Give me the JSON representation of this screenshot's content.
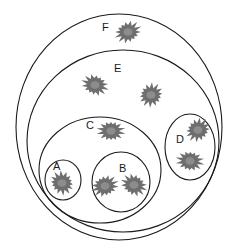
{
  "diagram": {
    "type": "nested-sets",
    "colors": {
      "boundary": "#1a1a1a",
      "blob": "#6e6e6e",
      "blob_center": "#8c8c8c",
      "background": "#ffffff"
    },
    "sets": [
      {
        "id": "F",
        "label": "F",
        "cx": 119,
        "cy": 127,
        "rx": 103,
        "ry": 113,
        "label_x": 102,
        "label_y": 31,
        "parent": null
      },
      {
        "id": "E",
        "label": "E",
        "cx": 123,
        "cy": 141,
        "rx": 96,
        "ry": 91,
        "label_x": 114,
        "label_y": 72,
        "parent": "F"
      },
      {
        "id": "C",
        "label": "C",
        "cx": 100,
        "cy": 170,
        "rx": 61,
        "ry": 53,
        "label_x": 86,
        "label_y": 129,
        "parent": "E"
      },
      {
        "id": "A",
        "label": "A",
        "cx": 63,
        "cy": 180,
        "rx": 18,
        "ry": 20,
        "label_x": 53,
        "label_y": 170,
        "parent": "C"
      },
      {
        "id": "B",
        "label": "B",
        "cx": 121,
        "cy": 182,
        "rx": 29,
        "ry": 30,
        "label_x": 119,
        "label_y": 172,
        "parent": "C"
      },
      {
        "id": "D",
        "label": "D",
        "cx": 190,
        "cy": 147,
        "rx": 25,
        "ry": 33,
        "label_x": 176,
        "label_y": 143,
        "parent": "E"
      }
    ],
    "elements": [
      {
        "set": "F",
        "x": 128,
        "y": 32
      },
      {
        "set": "E",
        "x": 95,
        "y": 85
      },
      {
        "set": "E",
        "x": 151,
        "y": 95
      },
      {
        "set": "C",
        "x": 111,
        "y": 131
      },
      {
        "set": "A",
        "x": 62,
        "y": 183
      },
      {
        "set": "B",
        "x": 105,
        "y": 186
      },
      {
        "set": "B",
        "x": 134,
        "y": 185
      },
      {
        "set": "D",
        "x": 198,
        "y": 130
      },
      {
        "set": "D",
        "x": 190,
        "y": 161
      }
    ]
  }
}
